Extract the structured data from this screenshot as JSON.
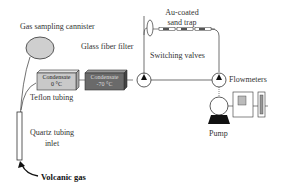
{
  "diagram": {
    "labels": {
      "gas_sampling_cannister": "Gas sampling cannister",
      "glass_fiber_filter": "Glass fiber filter",
      "au_coated_sand_trap": [
        "Au-coated",
        "sand trap"
      ],
      "switching_valves": "Switching valves",
      "flowmeters": "Flowmeters",
      "pump": "Pump",
      "teflon_tubing": "Teflon tubing",
      "quartz_tubing_inlet": [
        "Quartz tubing",
        "inlet"
      ],
      "volcanic_gas": "Volcanic gas"
    },
    "condensers": [
      {
        "label": "Condensate",
        "temp": "0 °C",
        "color": "#c9c9c9"
      },
      {
        "label": "Condensate",
        "temp": "-70 °C",
        "color": "#6a6a6a"
      }
    ],
    "colors": {
      "line": "#333333",
      "cannister_fill": "#cfcfcf",
      "pump_base": "#111111"
    }
  }
}
